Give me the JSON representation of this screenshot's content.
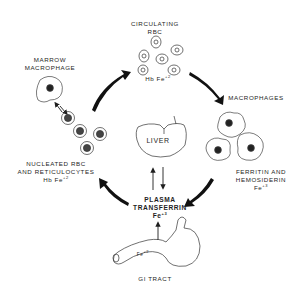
{
  "diagram": {
    "nodes": {
      "circulating_rbc": {
        "line1": "CIRCULATING",
        "line2": "RBC",
        "formula_base": "Hb Fe",
        "formula_charge": "+2"
      },
      "macrophages": {
        "label": "MACROPHAGES",
        "line1": "FERRITIN  AND",
        "line2": "HEMOSIDERIN",
        "formula_base": "Fe",
        "formula_charge": "+3"
      },
      "plasma_transferrin": {
        "line1": "PLASMA",
        "line2": "TRANSFERRIN",
        "formula_base": "Fe",
        "formula_charge": "+3"
      },
      "gi_tract": {
        "label": "GI TRACT",
        "inner_base": "Fe",
        "inner_charge": "+2"
      },
      "nucleated_rbc": {
        "line1": "NUCLEATED RBC",
        "line2": "AND RETICULOCYTES",
        "formula_base": "Hb Fe",
        "formula_charge": "+2"
      },
      "marrow_macrophage": {
        "line1": "MARROW",
        "line2": "MACROPHAGE"
      },
      "liver": {
        "label": "LIVER"
      }
    },
    "edges": [
      {
        "from": "nucleated_rbc",
        "to": "circulating_rbc"
      },
      {
        "from": "circulating_rbc",
        "to": "macrophages"
      },
      {
        "from": "macrophages",
        "to": "plasma_transferrin"
      },
      {
        "from": "plasma_transferrin",
        "to": "nucleated_rbc"
      },
      {
        "from": "plasma_transferrin",
        "to": "liver"
      },
      {
        "from": "liver",
        "to": "plasma_transferrin"
      },
      {
        "from": "gi_tract",
        "to": "plasma_transferrin"
      },
      {
        "from": "marrow_macrophage",
        "to": "nucleated_rbc",
        "bidirectional": true
      }
    ],
    "colors": {
      "ink": "#1e1e1e",
      "background": "#ffffff"
    }
  }
}
